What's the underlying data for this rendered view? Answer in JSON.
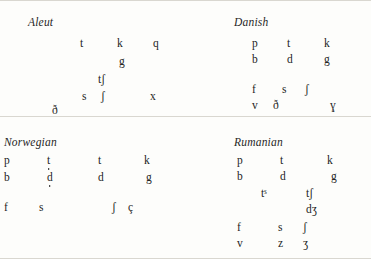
{
  "document": {
    "kind": "phoneme-inventory-chart-set",
    "background_color": "#fdfdfb",
    "text_color": "#242424",
    "rule_color": "#d9d7d0"
  },
  "panels": [
    {
      "id": "aleut",
      "title": "Aleut",
      "segments": [
        {
          "text": "t",
          "x": 80,
          "y": 38
        },
        {
          "text": "k",
          "x": 117,
          "y": 38
        },
        {
          "text": "q",
          "x": 153,
          "y": 38
        },
        {
          "text": "g",
          "x": 119,
          "y": 56
        },
        {
          "text": "tʃ",
          "x": 98,
          "y": 74
        },
        {
          "text": "s",
          "x": 82,
          "y": 91
        },
        {
          "text": "ʃ",
          "x": 101,
          "y": 91
        },
        {
          "text": "x",
          "x": 150,
          "y": 91
        },
        {
          "text": "ð",
          "x": 52,
          "y": 105
        }
      ]
    },
    {
      "id": "danish",
      "title": "Danish",
      "segments": [
        {
          "text": "p",
          "x": 66,
          "y": 38
        },
        {
          "text": "t",
          "x": 101,
          "y": 38
        },
        {
          "text": "k",
          "x": 138,
          "y": 38
        },
        {
          "text": "b",
          "x": 66,
          "y": 54
        },
        {
          "text": "d",
          "x": 101,
          "y": 54
        },
        {
          "text": "g",
          "x": 138,
          "y": 54
        },
        {
          "text": "f",
          "x": 66,
          "y": 84
        },
        {
          "text": "s",
          "x": 96,
          "y": 84
        },
        {
          "text": "ʃ",
          "x": 119,
          "y": 84
        },
        {
          "text": "v",
          "x": 66,
          "y": 100
        },
        {
          "text": "ð",
          "x": 87,
          "y": 100
        },
        {
          "text": "ɣ",
          "x": 144,
          "y": 100
        }
      ]
    },
    {
      "id": "norwegian",
      "title": "Norwegian",
      "segments": [
        {
          "text": "p",
          "x": 4,
          "y": 25
        },
        {
          "text": "t",
          "x": 47,
          "y": 25,
          "underdot": true
        },
        {
          "text": "t",
          "x": 98,
          "y": 25
        },
        {
          "text": "k",
          "x": 144,
          "y": 25
        },
        {
          "text": "b",
          "x": 4,
          "y": 42
        },
        {
          "text": "d",
          "x": 47,
          "y": 42,
          "underdot": true
        },
        {
          "text": "d",
          "x": 98,
          "y": 42
        },
        {
          "text": "g",
          "x": 146,
          "y": 42
        },
        {
          "text": "f",
          "x": 4,
          "y": 72
        },
        {
          "text": "s",
          "x": 39,
          "y": 72
        },
        {
          "text": "ʃ",
          "x": 112,
          "y": 72
        },
        {
          "text": "ç",
          "x": 128,
          "y": 72
        }
      ]
    },
    {
      "id": "rumanian",
      "title": "Rumanian",
      "segments": [
        {
          "text": "p",
          "x": 51,
          "y": 25
        },
        {
          "text": "t",
          "x": 94,
          "y": 25
        },
        {
          "text": "k",
          "x": 141,
          "y": 25
        },
        {
          "text": "b",
          "x": 51,
          "y": 41
        },
        {
          "text": "d",
          "x": 94,
          "y": 41
        },
        {
          "text": "g",
          "x": 145,
          "y": 41
        },
        {
          "text": "tˢ",
          "x": 75,
          "y": 58
        },
        {
          "text": "tʃ",
          "x": 120,
          "y": 58
        },
        {
          "text": "dʒ",
          "x": 120,
          "y": 74
        },
        {
          "text": "f",
          "x": 51,
          "y": 92
        },
        {
          "text": "s",
          "x": 92,
          "y": 92
        },
        {
          "text": "ʃ",
          "x": 117,
          "y": 92
        },
        {
          "text": "v",
          "x": 51,
          "y": 108
        },
        {
          "text": "z",
          "x": 92,
          "y": 108
        },
        {
          "text": "ʒ",
          "x": 117,
          "y": 108
        }
      ]
    }
  ]
}
